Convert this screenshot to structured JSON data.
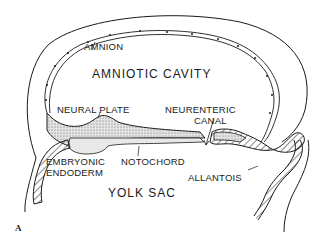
{
  "diagram": {
    "figure_label": "A",
    "labels": {
      "amnion": "AMNION",
      "amniotic_cavity": "AMNIOTIC CAVITY",
      "neural_plate": "NEURAL PLATE",
      "neurenteric_canal_line1": "NEURENTERIC",
      "neurenteric_canal_line2": "CANAL",
      "embryonic_endoderm_line1": "EMBRYONIC",
      "embryonic_endoderm_line2": "ENDODERM",
      "notochord": "NOTOCHORD",
      "allantois": "ALLANTOIS",
      "yolk_sac": "YOLK SAC"
    },
    "colors": {
      "line": "#1a1a1a",
      "stipple_fill": "#d9d9d9",
      "background": "#ffffff"
    }
  }
}
